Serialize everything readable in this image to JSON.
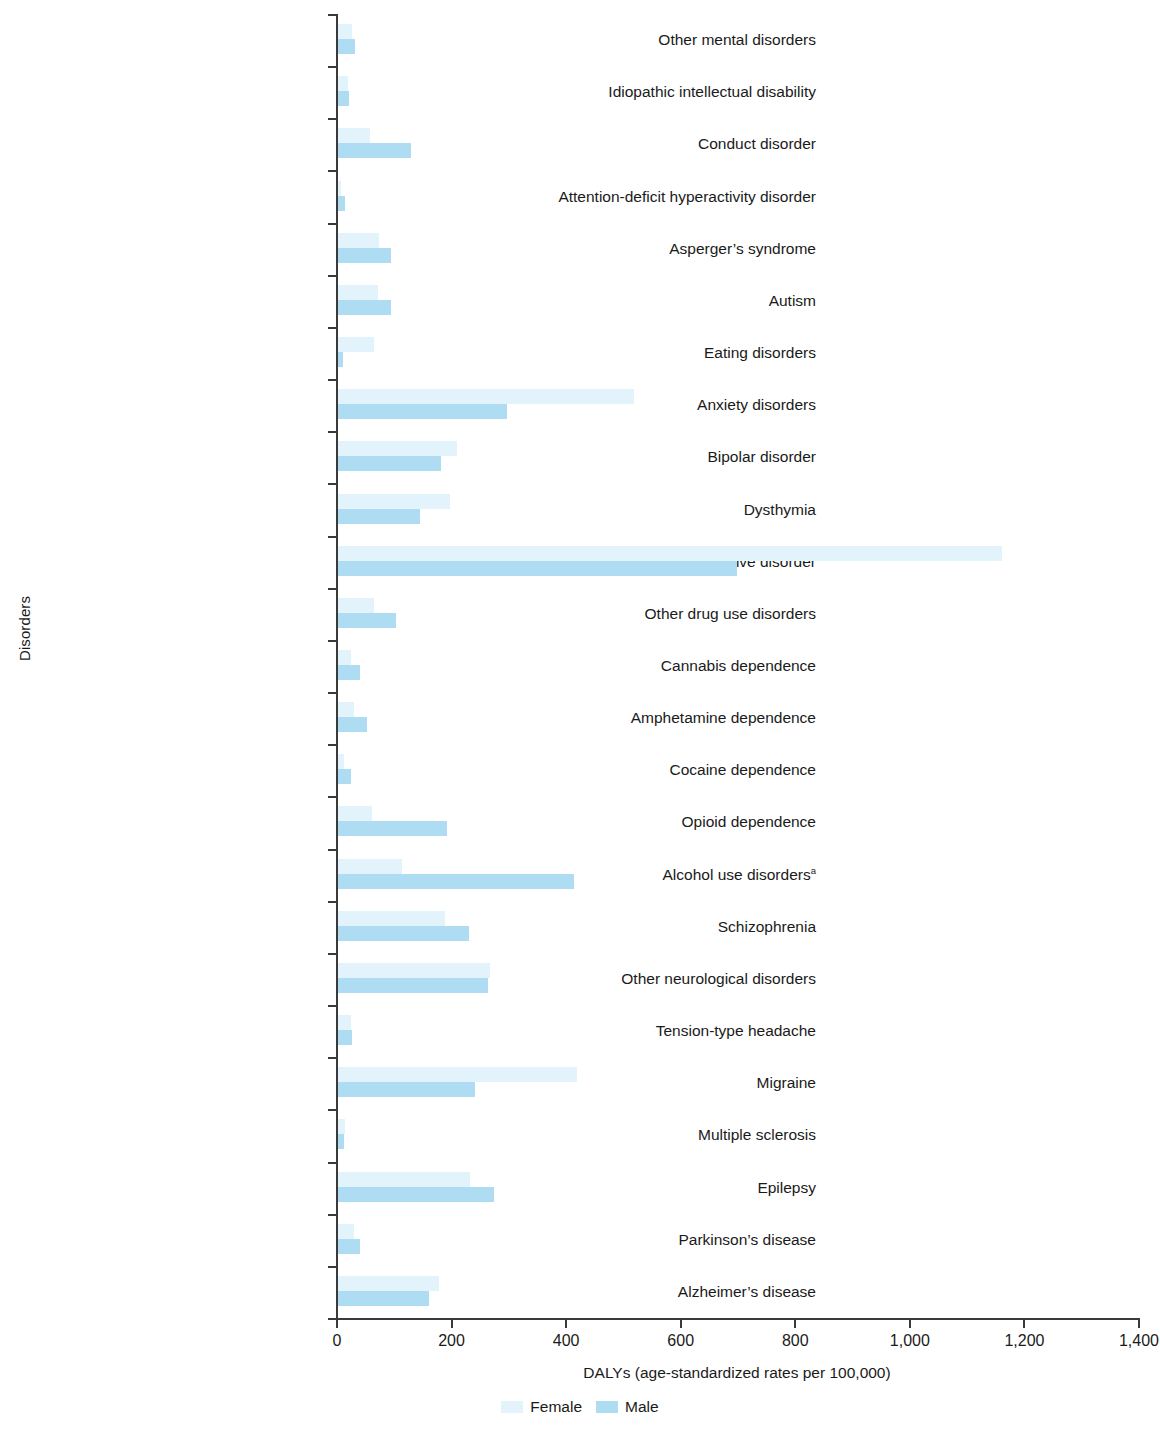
{
  "chart_data": {
    "type": "bar",
    "orientation": "horizontal",
    "title": "",
    "xlabel": "DALYs (age-standardized rates per 100,000)",
    "ylabel": "Disorders",
    "xlim": [
      0,
      1400
    ],
    "xticks": [
      0,
      200,
      400,
      600,
      800,
      1000,
      1200,
      1400
    ],
    "xticklabels": [
      "0",
      "200",
      "400",
      "600",
      "800",
      "1,000",
      "1,200",
      "1,400"
    ],
    "grid": false,
    "legend_position": "bottom-center",
    "colors": {
      "female": "#e3f3fb",
      "male": "#aedcf2"
    },
    "categories": [
      "Other mental disorders",
      "Idiopathic intellectual disability",
      "Conduct disorder",
      "Attention-deficit hyperactivity disorder",
      "Asperger’s syndrome",
      "Autism",
      "Eating disorders",
      "Anxiety disorders",
      "Bipolar disorder",
      "Dysthymia",
      "Major depressive disorder",
      "Other drug use disorders",
      "Cannabis dependence",
      "Amphetamine dependence",
      "Cocaine dependence",
      "Opioid dependence",
      "Alcohol use disorders",
      "Schizophrenia",
      "Other neurological disorders",
      "Tension-type headache",
      "Migraine",
      "Multiple sclerosis",
      "Epilepsy",
      "Parkinson’s disease",
      "Alzheimer’s disease"
    ],
    "category_footnotes": {
      "Alcohol use disorders": "a"
    },
    "series": [
      {
        "name": "Female",
        "values": [
          25,
          18,
          55,
          5,
          72,
          70,
          62,
          517,
          207,
          196,
          1159,
          62,
          22,
          28,
          10,
          60,
          112,
          186,
          265,
          22,
          417,
          12,
          230,
          28,
          176
        ]
      },
      {
        "name": "Male",
        "values": [
          30,
          20,
          127,
          12,
          92,
          92,
          8,
          295,
          180,
          144,
          696,
          102,
          38,
          50,
          22,
          190,
          412,
          228,
          262,
          25,
          239,
          10,
          272,
          38,
          159
        ]
      }
    ]
  },
  "legend": {
    "items": [
      {
        "label": "Female",
        "color": "#e3f3fb"
      },
      {
        "label": "Male",
        "color": "#aedcf2"
      }
    ]
  }
}
